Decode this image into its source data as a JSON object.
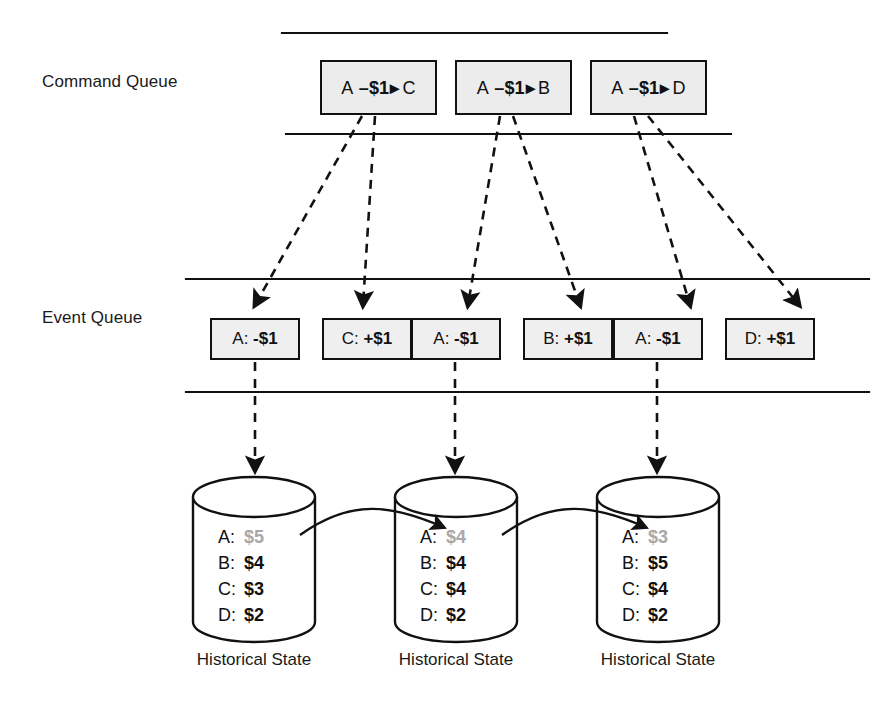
{
  "diagram": {
    "lanes": [
      {
        "id": "command",
        "label": "Command Queue"
      },
      {
        "id": "event",
        "label": "Event Queue"
      }
    ],
    "command_queue": {
      "label": "Command Queue",
      "items": [
        {
          "from": "A",
          "amount": "–$1",
          "arrow": "▸",
          "to": "C"
        },
        {
          "from": "A",
          "amount": "–$1",
          "arrow": "▸",
          "to": "B"
        },
        {
          "from": "A",
          "amount": "–$1",
          "arrow": "▸",
          "to": "D"
        }
      ]
    },
    "event_queue": {
      "label": "Event Queue",
      "items": [
        {
          "account": "A:",
          "amount": "-$1"
        },
        {
          "account": "C:",
          "amount": "+$1"
        },
        {
          "account": "A:",
          "amount": "-$1"
        },
        {
          "account": "B:",
          "amount": "+$1"
        },
        {
          "account": "A:",
          "amount": "-$1"
        },
        {
          "account": "D:",
          "amount": "+$1"
        }
      ]
    },
    "historical_states": [
      {
        "caption": "Historical State",
        "rows": [
          {
            "key": "A:",
            "value": "$5",
            "muted": true
          },
          {
            "key": "B:",
            "value": "$4",
            "muted": false
          },
          {
            "key": "C:",
            "value": "$3",
            "muted": false
          },
          {
            "key": "D:",
            "value": "$2",
            "muted": false
          }
        ]
      },
      {
        "caption": "Historical State",
        "rows": [
          {
            "key": "A:",
            "value": "$4",
            "muted": true
          },
          {
            "key": "B:",
            "value": "$4",
            "muted": false
          },
          {
            "key": "C:",
            "value": "$4",
            "muted": false
          },
          {
            "key": "D:",
            "value": "$2",
            "muted": false
          }
        ]
      },
      {
        "caption": "Historical State",
        "rows": [
          {
            "key": "A:",
            "value": "$3",
            "muted": true
          },
          {
            "key": "B:",
            "value": "$5",
            "muted": false
          },
          {
            "key": "C:",
            "value": "$4",
            "muted": false
          },
          {
            "key": "D:",
            "value": "$2",
            "muted": false
          }
        ]
      }
    ],
    "colors": {
      "stroke": "#111111",
      "command_fill": "#ececec",
      "event_fill": "#efefef",
      "muted_value": "#a8a8a8",
      "background": "#ffffff"
    }
  }
}
